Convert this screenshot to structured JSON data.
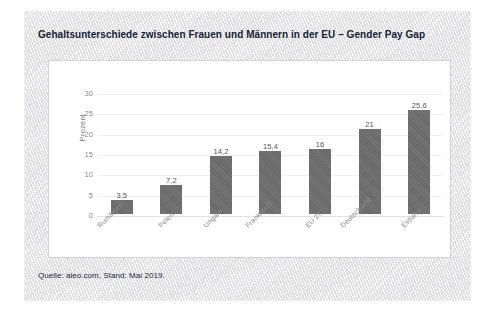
{
  "card": {
    "title": "Gehaltsunterschiede zwischen Frauen und Männern in der EU – Gender Pay Gap",
    "source_note": "Quelle: aleo.com, Stand: Mai 2019.",
    "background_color": "#ececec",
    "title_color": "#16213a"
  },
  "chart_data": {
    "type": "bar",
    "title": "Gehaltsunterschiede zwischen Frauen und Männern in der EU – Gender Pay Gap",
    "subtitle": "",
    "xlabel": "",
    "ylabel": "Prozent",
    "categories": [
      "Rumänien",
      "Polen",
      "Ungarn",
      "Frankreich",
      "EU 27",
      "Deutschland",
      "Estland"
    ],
    "values": [
      3.5,
      7.2,
      14.2,
      15.4,
      16,
      21,
      25.6
    ],
    "value_labels": [
      "3,5",
      "7,2",
      "14,2",
      "15,4",
      "16",
      "21",
      "25,6"
    ],
    "ylim": [
      0,
      30
    ],
    "yticks": [
      0,
      5,
      10,
      15,
      20,
      25,
      30
    ],
    "ytick_labels": [
      "0",
      "5",
      "10",
      "15",
      "20",
      "25",
      "30"
    ],
    "grid": true,
    "grid_axis": "y",
    "legend": false,
    "legend_position": "none",
    "bar_color": "#6e6e6e",
    "tick_label_rotation": -45,
    "source": "aleo.com, Stand: Mai 2019"
  }
}
